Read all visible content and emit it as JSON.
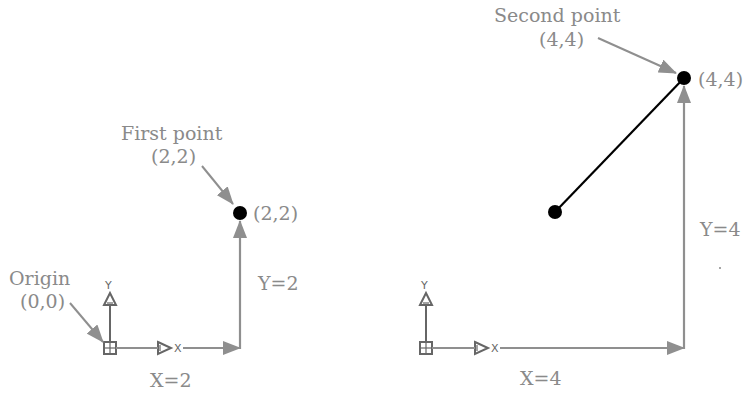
{
  "colors": {
    "background": "#ffffff",
    "label": "#8a8a8a",
    "arrow": "#8f8f8f",
    "ucs": "#666666",
    "point": "#000000",
    "line": "#000000"
  },
  "left_diagram": {
    "origin_label": "Origin",
    "origin_coords": "(0,0)",
    "first_point_label": "First point",
    "first_point_coords": "(2,2)",
    "point_coords_label": "(2,2)",
    "x_distance_label": "X=2",
    "y_distance_label": "Y=2",
    "ucs_x_label": "X",
    "ucs_y_label": "Y"
  },
  "right_diagram": {
    "second_point_label": "Second point",
    "second_point_coords": "(4,4)",
    "point_coords_label": "(4,4)",
    "x_distance_label": "X=4",
    "y_distance_label": "Y=4",
    "ucs_x_label": "X",
    "ucs_y_label": "Y"
  }
}
